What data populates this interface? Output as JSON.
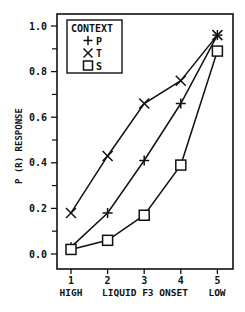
{
  "chart_data": {
    "type": "line",
    "title": "",
    "xlabel": "HIGH  LIQUID F3 ONSET  LOW",
    "xlabel_parts": {
      "left": "HIGH",
      "center": "LIQUID F3 ONSET",
      "right": "LOW"
    },
    "ylabel": "P (R) RESPONSE",
    "x": [
      1,
      2,
      3,
      4,
      5
    ],
    "x_tick_labels": [
      "1",
      "2",
      "3",
      "4",
      "5"
    ],
    "y_tick_labels": [
      "0.0",
      "0.2",
      "0.4",
      "0.6",
      "0.8",
      "1.0"
    ],
    "y_ticks": [
      0.0,
      0.2,
      0.4,
      0.6,
      0.8,
      1.0
    ],
    "xlim": [
      0.9,
      5.3
    ],
    "ylim": [
      -0.07,
      1.05
    ],
    "grid": false,
    "legend": {
      "title": "CONTEXT",
      "position": "upper left"
    },
    "series": [
      {
        "name": "P",
        "marker": "plus",
        "values": [
          0.03,
          0.18,
          0.41,
          0.66,
          0.96
        ]
      },
      {
        "name": "T",
        "marker": "x",
        "values": [
          0.18,
          0.43,
          0.66,
          0.76,
          0.96
        ]
      },
      {
        "name": "S",
        "marker": "square",
        "values": [
          0.02,
          0.06,
          0.17,
          0.39,
          0.89
        ]
      }
    ]
  },
  "style": {
    "line_color": "#111111",
    "background": "#ffffff"
  }
}
